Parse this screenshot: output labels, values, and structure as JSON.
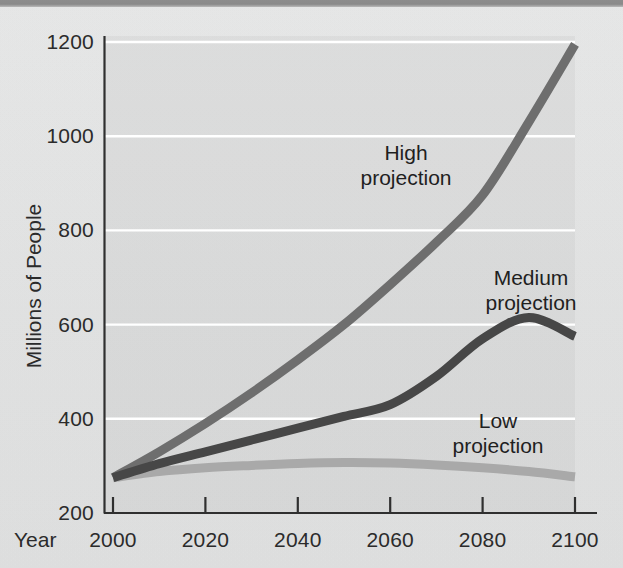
{
  "figure": {
    "background_color": "#e8e8e8",
    "top_band_color": "#8d8d8d"
  },
  "axes": {
    "y_title": "Millions of People",
    "x_title": "Year",
    "y_ticks": [
      "200",
      "400",
      "600",
      "800",
      "1000",
      "1200"
    ],
    "x_ticks": [
      "2000",
      "2020",
      "2040",
      "2060",
      "2080",
      "2100"
    ]
  },
  "annotations": {
    "high": {
      "line1": "High",
      "line2": "projection"
    },
    "medium": {
      "line1": "Medium",
      "line2": "projection"
    },
    "low": {
      "line1": "Low",
      "line2": "projection"
    }
  },
  "chart_data": {
    "type": "line",
    "title": "",
    "xlabel": "Year",
    "ylabel": "Millions of People",
    "xlim": [
      2000,
      2100
    ],
    "ylim": [
      200,
      1200
    ],
    "xticks": [
      2000,
      2020,
      2040,
      2060,
      2080,
      2100
    ],
    "yticks": [
      200,
      400,
      600,
      800,
      1000,
      1200
    ],
    "grid": "horizontal-only-white",
    "legend": "inline-annotations",
    "x": [
      2000,
      2010,
      2020,
      2030,
      2040,
      2050,
      2060,
      2070,
      2080,
      2090,
      2100
    ],
    "series": [
      {
        "name": "High projection",
        "color": "#6e6e6e",
        "line_width": 9,
        "values": [
          275,
          330,
          390,
          455,
          525,
          600,
          685,
          775,
          875,
          1030,
          1195
        ]
      },
      {
        "name": "Medium projection",
        "color": "#474747",
        "line_width": 9,
        "values": [
          275,
          305,
          330,
          355,
          380,
          405,
          430,
          490,
          570,
          615,
          575
        ]
      },
      {
        "name": "Low projection",
        "color": "#a9a9a9",
        "line_width": 9,
        "values": [
          275,
          288,
          296,
          301,
          305,
          307,
          306,
          302,
          296,
          288,
          277
        ]
      }
    ]
  },
  "geometry": {
    "plot_left": 113,
    "plot_right": 575,
    "y_for_200": 513,
    "y_for_1200": 42
  }
}
